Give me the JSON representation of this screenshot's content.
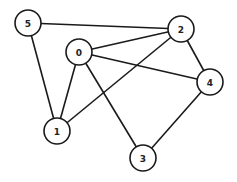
{
  "diagram": {
    "type": "undirected-graph",
    "colors": {
      "stroke": "#1a1a1a",
      "fill": "#ffffff",
      "label": "#222222"
    },
    "node_radius": 13,
    "nodes": [
      {
        "id": "0",
        "label": "0",
        "x": 79,
        "y": 52
      },
      {
        "id": "1",
        "label": "1",
        "x": 57,
        "y": 131
      },
      {
        "id": "2",
        "label": "2",
        "x": 181,
        "y": 29
      },
      {
        "id": "3",
        "label": "3",
        "x": 143,
        "y": 158
      },
      {
        "id": "4",
        "label": "4",
        "x": 210,
        "y": 82
      },
      {
        "id": "5",
        "label": "5",
        "x": 28,
        "y": 23
      }
    ],
    "edges": [
      {
        "from": "5",
        "to": "2"
      },
      {
        "from": "5",
        "to": "1"
      },
      {
        "from": "0",
        "to": "2"
      },
      {
        "from": "0",
        "to": "4"
      },
      {
        "from": "0",
        "to": "1"
      },
      {
        "from": "0",
        "to": "3"
      },
      {
        "from": "2",
        "to": "1"
      },
      {
        "from": "2",
        "to": "4"
      },
      {
        "from": "4",
        "to": "3"
      }
    ]
  }
}
